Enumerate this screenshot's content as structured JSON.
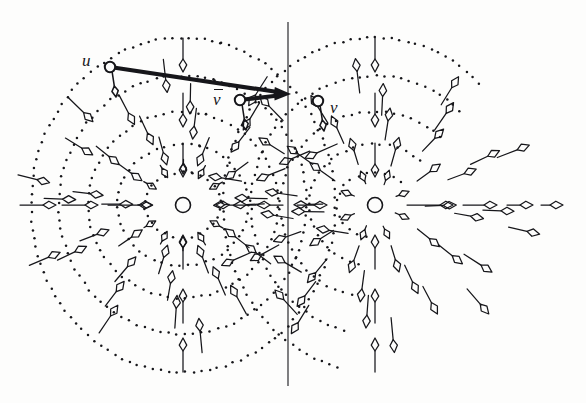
{
  "figure": {
    "kind": "vector-field-diagram",
    "width": 586,
    "height": 403,
    "background_color": "#fdfdfc",
    "ink_color": "#16161a"
  },
  "labels": {
    "u": {
      "text": "u",
      "x": 82,
      "y": 52
    },
    "v_bar": {
      "text": "v",
      "overbar": true,
      "x": 213,
      "y": 89
    },
    "v": {
      "text": "v",
      "x": 330,
      "y": 99
    }
  },
  "marked_points": [
    {
      "name": "u",
      "cx": 110,
      "cy": 67,
      "r": 5.2
    },
    {
      "name": "v-bar",
      "cx": 240,
      "cy": 100,
      "r": 5.2
    },
    {
      "name": "v",
      "cx": 318,
      "cy": 101,
      "r": 5.2
    }
  ],
  "thick_vectors": [
    {
      "name": "u-to-axis",
      "from": [
        110,
        67
      ],
      "to": [
        291,
        94
      ],
      "stroke_width": 4.2,
      "head_length": 17,
      "head_width": 9
    },
    {
      "name": "v-bar-to-axis",
      "from": [
        240,
        100
      ],
      "to": [
        291,
        94
      ],
      "stroke_width": 4.2,
      "head_length": 17,
      "head_width": 9
    }
  ],
  "axis_line": {
    "name": "vertical-symmetry-axis",
    "x": 288,
    "y_top": 22,
    "y_bottom": 386,
    "stroke_width": 1.1
  },
  "singularities": [
    {
      "name": "sink",
      "cx": 183,
      "cy": 205,
      "r": 7.5,
      "type": "inward"
    },
    {
      "name": "source",
      "cx": 375,
      "cy": 205,
      "r": 7.5,
      "type": "outward"
    }
  ],
  "contours": {
    "style": "dotted",
    "dot_radius": 1.25,
    "dot_spacing": 8.5,
    "left_rings": [
      38,
      66,
      95,
      124,
      152
    ],
    "right_rings": [
      38,
      66,
      95,
      124,
      152
    ],
    "ring_aspect": 0.86
  },
  "field": {
    "arrow_color": "#16161a",
    "shaft_width": 1.25,
    "head_length": 13,
    "head_width": 7.5,
    "note": "Arrows point toward the left sink and away from the right source; above the centres the flow runs downward, below it runs upward."
  },
  "chart_data": {
    "type": "scatter",
    "title": "",
    "xlabel": "",
    "ylabel": "",
    "xlim": [
      0,
      586
    ],
    "ylim": [
      403,
      0
    ],
    "grid": false,
    "legend": "none",
    "series": [
      {
        "name": "singular points",
        "x": [
          183,
          375
        ],
        "y": [
          205,
          205
        ],
        "annotations": [
          "sink",
          "source"
        ]
      },
      {
        "name": "marked points",
        "x": [
          110,
          240,
          318
        ],
        "y": [
          67,
          100,
          101
        ],
        "annotations": [
          "u",
          "v̄",
          "v"
        ]
      }
    ]
  }
}
